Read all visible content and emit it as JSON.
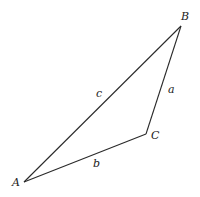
{
  "diagram": {
    "type": "triangle",
    "vertices": [
      {
        "id": "A",
        "label": "A",
        "x": 24,
        "y": 182,
        "label_x": 12,
        "label_y": 186
      },
      {
        "id": "B",
        "label": "B",
        "x": 181,
        "y": 26,
        "label_x": 181,
        "label_y": 20
      },
      {
        "id": "C",
        "label": "C",
        "x": 146,
        "y": 134,
        "label_x": 151,
        "label_y": 139
      }
    ],
    "sides": [
      {
        "id": "a",
        "label": "a",
        "from": "B",
        "to": "C",
        "label_x": 168,
        "label_y": 93
      },
      {
        "id": "b",
        "label": "b",
        "from": "C",
        "to": "A",
        "label_x": 93,
        "label_y": 167
      },
      {
        "id": "c",
        "label": "c",
        "from": "A",
        "to": "B",
        "label_x": 96,
        "label_y": 97
      }
    ],
    "stroke_color": "#2a2a2a"
  }
}
